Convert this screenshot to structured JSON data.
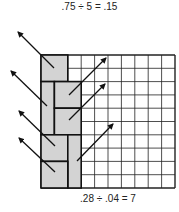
{
  "captions": {
    "top": ".75 ÷ 5 = .15",
    "bottom": ".28 ÷ .04 = 7"
  },
  "grid": {
    "x": 41,
    "y": 55,
    "width": 134,
    "height": 133,
    "cols": 10,
    "rows": 10,
    "line_color": "#222222",
    "fill_color": "#ffffff"
  },
  "shaded_blocks": {
    "fill": "#d3d3d3",
    "border": "#111111",
    "items": [
      {
        "col": 0,
        "row": 0,
        "w": 2,
        "h": 2
      },
      {
        "col": 0,
        "row": 2,
        "w": 1,
        "h": 4
      },
      {
        "col": 1,
        "row": 2,
        "w": 2,
        "h": 2
      },
      {
        "col": 1,
        "row": 4,
        "w": 2,
        "h": 2
      },
      {
        "col": 0,
        "row": 6,
        "w": 2,
        "h": 2
      },
      {
        "col": 2,
        "row": 6,
        "w": 1,
        "h": 4
      },
      {
        "col": 0,
        "row": 8,
        "w": 2,
        "h": 2
      }
    ]
  },
  "arrows": {
    "color": "#111111",
    "items": [
      {
        "from": [
          54,
          68
        ],
        "to": [
          18,
          32
        ]
      },
      {
        "from": [
          47,
          106
        ],
        "to": [
          11,
          71
        ]
      },
      {
        "from": [
          55,
          146
        ],
        "to": [
          19,
          111
        ]
      },
      {
        "from": [
          55,
          172
        ],
        "to": [
          19,
          138
        ]
      },
      {
        "from": [
          69,
          95
        ],
        "to": [
          106,
          58
        ]
      },
      {
        "from": [
          69,
          120
        ],
        "to": [
          105,
          84
        ]
      },
      {
        "from": [
          77,
          161
        ],
        "to": [
          113,
          124
        ]
      }
    ]
  }
}
